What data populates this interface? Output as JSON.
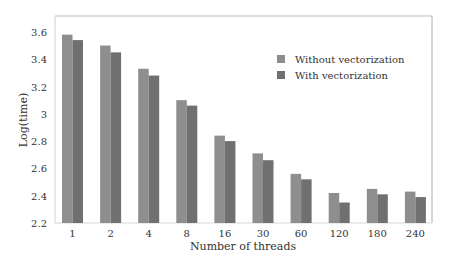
{
  "chart_data": {
    "type": "bar",
    "title": "",
    "xlabel": "Number of threads",
    "ylabel": "Log(time)",
    "ylim": [
      2.2,
      3.72
    ],
    "yticks": [
      2.2,
      2.4,
      2.6,
      2.8,
      3,
      3.2,
      3.4,
      3.6
    ],
    "ytick_labels": [
      "2.2",
      "2.4",
      "2.6",
      "2.8",
      "3",
      "3.2",
      "3.4",
      "3.6"
    ],
    "grid": false,
    "legend_position": "upper right (inside)",
    "categories": [
      "1",
      "2",
      "4",
      "8",
      "16",
      "30",
      "60",
      "120",
      "180",
      "240"
    ],
    "series": [
      {
        "name": "Without vectorization",
        "color": "#8e8e8e",
        "values": [
          3.58,
          3.5,
          3.33,
          3.1,
          2.84,
          2.71,
          2.56,
          2.42,
          2.45,
          2.43
        ]
      },
      {
        "name": "With vectorization",
        "color": "#707070",
        "values": [
          3.54,
          3.45,
          3.28,
          3.06,
          2.8,
          2.66,
          2.52,
          2.35,
          2.41,
          2.39
        ]
      }
    ]
  }
}
